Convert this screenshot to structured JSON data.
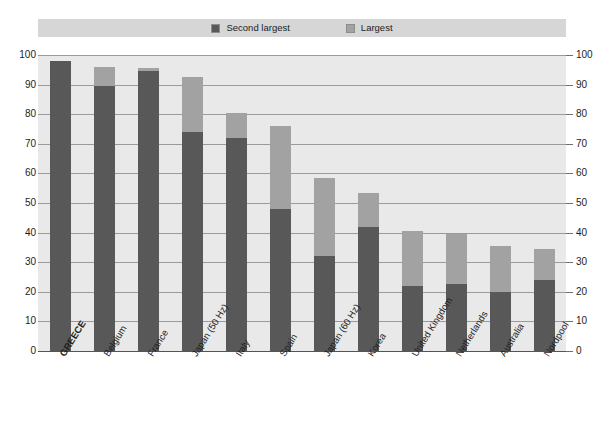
{
  "chart_data": {
    "type": "bar",
    "stacked": true,
    "title": "",
    "subtitle": "",
    "xlabel": "",
    "ylabel": "",
    "ylim": [
      0,
      100
    ],
    "yticks": [
      0,
      10,
      20,
      30,
      40,
      50,
      60,
      70,
      80,
      90,
      100
    ],
    "ytick_labels": [
      "0",
      "10",
      "20",
      "30",
      "40",
      "50",
      "60",
      "70",
      "80",
      "90",
      "100"
    ],
    "dual_y_axis": true,
    "grid": true,
    "legend_position": "top-center",
    "categories": [
      "GREECE",
      "Belgium",
      "France",
      "Japan (50 Hz)",
      "Italy",
      "Spain",
      "Japan (60 Hz)",
      "Korea",
      "United Kingdom",
      "Netherlands",
      "Australia",
      "Nordpool"
    ],
    "highlighted_category": "GREECE",
    "series": [
      {
        "name": "Second largest",
        "color": "#585858",
        "values": [
          98,
          89.5,
          94.5,
          74,
          72,
          48,
          32,
          42,
          22,
          22.5,
          20,
          24
        ]
      },
      {
        "name": "Largest",
        "color": "#a2a2a2",
        "values": [
          0,
          6.5,
          1,
          18.5,
          8.5,
          28,
          26.5,
          11.5,
          18.5,
          17,
          15.5,
          10.5
        ]
      }
    ],
    "totals": [
      98,
      96,
      95.5,
      92.5,
      80.5,
      76,
      58.5,
      53.5,
      40.5,
      39.5,
      35.5,
      34.5
    ],
    "legend": [
      {
        "label": "Second largest",
        "color": "#585858",
        "swatch": "legend-swatch-dark"
      },
      {
        "label": "Largest",
        "color": "#a2a2a2",
        "swatch": "legend-swatch-light"
      }
    ],
    "colors": {
      "plot_background": "#e9e9e9",
      "legend_band": "#d6d6d6",
      "gridline": "#9a9a9a",
      "axis": "#555555",
      "text": "#1d1d1d",
      "second_largest": "#585858",
      "largest": "#a2a2a2"
    }
  }
}
